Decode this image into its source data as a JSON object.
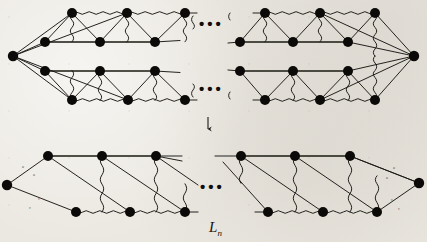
{
  "figure": {
    "kind": "graph-diagram",
    "caption": "L_n",
    "caption_base": "L",
    "caption_sub": "n",
    "transform_arrow": "↓",
    "continuation_marks": [
      "•••",
      "•••",
      "•••"
    ],
    "background_color": "#ebe8e1",
    "node_color": "#0c0a08",
    "edge_color": "#1a1714"
  },
  "top_graph": {
    "name": "wheel-like-graph-upper",
    "apex_left": {
      "name": "apex-left",
      "cx": 13,
      "cy": 56
    },
    "apex_right": {
      "name": "apex-right",
      "cx": 414,
      "cy": 56
    },
    "rows": [
      {
        "name": "row-1-top-outer",
        "y": 13,
        "left_nodes_x": [
          72,
          127,
          185
        ],
        "right_nodes_x": [
          265,
          320,
          375
        ]
      },
      {
        "name": "row-2-top-inner",
        "y": 42,
        "left_nodes_x": [
          45,
          100,
          155
        ],
        "right_nodes_x": [
          240,
          293,
          348
        ]
      },
      {
        "name": "row-3-bottom-inner",
        "y": 71,
        "left_nodes_x": [
          45,
          100,
          155
        ],
        "right_nodes_x": [
          240,
          293,
          348
        ]
      },
      {
        "name": "row-4-bottom-outer",
        "y": 100,
        "left_nodes_x": [
          72,
          128,
          185
        ],
        "right_nodes_x": [
          265,
          320,
          375
        ]
      }
    ],
    "ellipsis_upper": {
      "x": 199,
      "y": 14
    },
    "ellipsis_lower": {
      "x": 199,
      "y": 79
    }
  },
  "bottom_graph": {
    "name": "ladder-graph-lower",
    "apex_left": {
      "name": "apex-left",
      "cx": 7,
      "cy": 185
    },
    "apex_right": {
      "name": "apex-right",
      "cx": 419,
      "cy": 183
    },
    "rows": [
      {
        "name": "row-top",
        "y": 156,
        "left_nodes_x": [
          48,
          102,
          156
        ],
        "right_nodes_x": [
          241,
          295,
          350
        ]
      },
      {
        "name": "row-bottom",
        "y": 212,
        "left_nodes_x": [
          76,
          130,
          185
        ],
        "right_nodes_x": [
          268,
          323,
          377
        ]
      }
    ],
    "ellipsis": {
      "x": 201,
      "y": 177
    }
  },
  "arrow": {
    "name": "downward-transform-arrow",
    "x": 208,
    "y": 117
  },
  "edge_labels_faint": [
    "u",
    "u",
    "v",
    "v",
    "u",
    "u",
    "v",
    "v"
  ]
}
